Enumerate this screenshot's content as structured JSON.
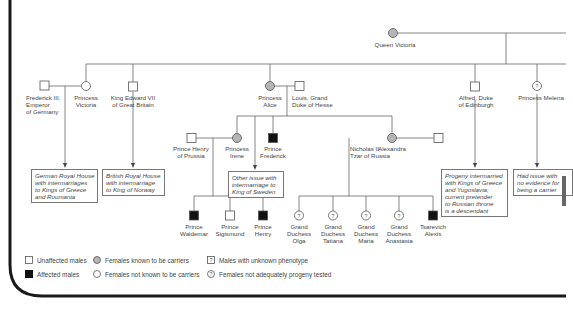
{
  "colors": {
    "carrier_fill": "#b5b5b5",
    "affected_fill": "#111111",
    "line": "#666666",
    "border": "#1a1a1a"
  },
  "people": {
    "queen_victoria": "Queen Victoria",
    "frederick": "Frederick III,\nEmperor\nof Germany",
    "victoria": "Princess\nVictoria",
    "edward": "King Edward VII\nof Great Britain",
    "alice": "Princess\nAlice",
    "louis": "Louis, Grand\nDuke of Hesse",
    "alfred": "Alfred, Duke\nof Edinburgh",
    "melena": "Princess Melena",
    "henry_prussia": "Prince Henry\nof Prussia",
    "irene": "Princess\nIrene",
    "frederick_prince": "Prince\nFrederick",
    "alexandra": "Alexandra",
    "nicholas": "Nicholas II,\nTzar of Russia",
    "waldemar": "Prince\nWaldemar",
    "sigismund": "Prince\nSigismund",
    "henry_prince": "Prince\nHenry",
    "olga": "Grand\nDuchess\nOlga",
    "tatiana": "Grand\nDuchess\nTatiana",
    "maria": "Grand\nDuchess\nMaria",
    "anastasia": "Grand\nDuchess\nAnastasia",
    "alexis": "Tsarevich\nAlexis"
  },
  "notes": {
    "german": "German Royal House\nwith intermarriages\nto Kings of Greece\nand Roumania",
    "british": "British Royal House\nwith intermarriage\nto King of Norway",
    "sweden": "Other issue with\nintermarriage to\nKing of Sweden",
    "edinburgh": "Progeny intermarried\nwith Kings of Greece\nand Yugoslavia;\ncurrent pretender\nto Russian throne\nis a descendant",
    "melena": "Had issue with\nno evidence for\nbeing a carrier"
  },
  "legend": {
    "unaffected_males": "Unaffected males",
    "affected_males": "Affected males",
    "carrier_females": "Females known to be carriers",
    "noncarrier_females": "Females not known to be carriers",
    "unknown_males": "Males with unknown phenotype",
    "untested_females": "Females not adequately progeny tested"
  }
}
